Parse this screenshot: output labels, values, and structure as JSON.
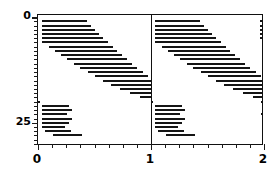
{
  "chart_data": {
    "type": "line",
    "title": "",
    "xlabel": "",
    "ylabel": "",
    "xlim": [
      0,
      2
    ],
    "ylim": [
      30.5,
      -0.5
    ],
    "grid": false,
    "legend": null,
    "x_ticks": [
      {
        "value": 0,
        "label": "0",
        "major": true
      },
      {
        "value": 0.125,
        "label": "",
        "major": false
      },
      {
        "value": 0.25,
        "label": "",
        "major": false
      },
      {
        "value": 0.375,
        "label": "",
        "major": false
      },
      {
        "value": 0.5,
        "label": "",
        "major": false
      },
      {
        "value": 0.625,
        "label": "",
        "major": false
      },
      {
        "value": 0.75,
        "label": "",
        "major": false
      },
      {
        "value": 0.875,
        "label": "",
        "major": false
      },
      {
        "value": 1,
        "label": "1",
        "major": true
      },
      {
        "value": 1.125,
        "label": "",
        "major": false
      },
      {
        "value": 1.25,
        "label": "",
        "major": false
      },
      {
        "value": 1.375,
        "label": "",
        "major": false
      },
      {
        "value": 1.5,
        "label": "",
        "major": false
      },
      {
        "value": 1.625,
        "label": "",
        "major": false
      },
      {
        "value": 1.75,
        "label": "",
        "major": false
      },
      {
        "value": 1.875,
        "label": "",
        "major": false
      },
      {
        "value": 2,
        "label": "2",
        "major": true
      }
    ],
    "y_ticks": [
      {
        "value": 0,
        "label": "0",
        "major": true
      },
      {
        "value": 1,
        "label": "",
        "major": false
      },
      {
        "value": 2,
        "label": "",
        "major": false
      },
      {
        "value": 3,
        "label": "",
        "major": false
      },
      {
        "value": 4,
        "label": "",
        "major": false
      },
      {
        "value": 5,
        "label": "",
        "major": false
      },
      {
        "value": 6,
        "label": "",
        "major": false
      },
      {
        "value": 7,
        "label": "",
        "major": false
      },
      {
        "value": 8,
        "label": "",
        "major": false
      },
      {
        "value": 9,
        "label": "",
        "major": false
      },
      {
        "value": 10,
        "label": "",
        "major": false
      },
      {
        "value": 11,
        "label": "",
        "major": false
      },
      {
        "value": 12,
        "label": "",
        "major": false
      },
      {
        "value": 13,
        "label": "",
        "major": false
      },
      {
        "value": 14,
        "label": "",
        "major": false
      },
      {
        "value": 15,
        "label": "",
        "major": false
      },
      {
        "value": 16,
        "label": "",
        "major": false
      },
      {
        "value": 17,
        "label": "",
        "major": false
      },
      {
        "value": 18,
        "label": "",
        "major": false
      },
      {
        "value": 19,
        "label": "",
        "major": false
      },
      {
        "value": 20,
        "label": "",
        "major": false
      },
      {
        "value": 21,
        "label": "",
        "major": false
      },
      {
        "value": 22,
        "label": "",
        "major": false
      },
      {
        "value": 23,
        "label": "",
        "major": false
      },
      {
        "value": 24,
        "label": "",
        "major": false
      },
      {
        "value": 25,
        "label": "25",
        "major": true
      },
      {
        "value": 26,
        "label": "",
        "major": false
      },
      {
        "value": 27,
        "label": "",
        "major": false
      },
      {
        "value": 28,
        "label": "",
        "major": false
      },
      {
        "value": 29,
        "label": "",
        "major": false
      },
      {
        "value": 30,
        "label": "",
        "major": false
      }
    ],
    "series": [
      {
        "name": "cycle-1",
        "type": "segments",
        "segments": [
          {
            "y": 1,
            "x0": 0.035,
            "x1": 0.43
          },
          {
            "y": 2,
            "x0": 0.035,
            "x1": 0.47
          },
          {
            "y": 3,
            "x0": 0.035,
            "x1": 0.505
          },
          {
            "y": 4,
            "x0": 0.035,
            "x1": 0.54
          },
          {
            "y": 5,
            "x0": 0.035,
            "x1": 0.575
          },
          {
            "y": 6,
            "x0": 0.035,
            "x1": 0.62
          },
          {
            "y": 7,
            "x0": 0.1,
            "x1": 0.665
          },
          {
            "y": 8,
            "x0": 0.15,
            "x1": 0.7
          },
          {
            "y": 9,
            "x0": 0.2,
            "x1": 0.745
          },
          {
            "y": 10,
            "x0": 0.255,
            "x1": 0.79
          },
          {
            "y": 11,
            "x0": 0.315,
            "x1": 0.835
          },
          {
            "y": 12,
            "x0": 0.375,
            "x1": 0.88
          },
          {
            "y": 13,
            "x0": 0.44,
            "x1": 0.925
          },
          {
            "y": 14,
            "x0": 0.505,
            "x1": 0.97
          },
          {
            "y": 15,
            "x0": 0.575,
            "x1": 1.0
          },
          {
            "y": 16,
            "x0": 0.65,
            "x1": 1.0
          },
          {
            "y": 17,
            "x0": 0.73,
            "x1": 1.0
          },
          {
            "y": 18,
            "x0": 0.815,
            "x1": 1.0
          },
          {
            "y": 19,
            "x0": 0.905,
            "x1": 1.0
          },
          {
            "y": 20,
            "x0": 0.0,
            "x1": 0.02
          },
          {
            "y": 21,
            "x0": 0.035,
            "x1": 0.27
          },
          {
            "y": 22,
            "x0": 0.035,
            "x1": 0.305
          },
          {
            "y": 23,
            "x0": 0.035,
            "x1": 0.255
          },
          {
            "y": 24,
            "x0": 0.035,
            "x1": 0.3
          },
          {
            "y": 25,
            "x0": 0.035,
            "x1": 0.27
          },
          {
            "y": 26,
            "x0": 0.035,
            "x1": 0.235
          },
          {
            "y": 27,
            "x0": 0.06,
            "x1": 0.29
          },
          {
            "y": 28,
            "x0": 0.13,
            "x1": 0.39
          }
        ]
      },
      {
        "name": "cycle-2",
        "type": "segments",
        "segments": [
          {
            "y": 1,
            "x0": 1.035,
            "x1": 1.43
          },
          {
            "y": 2,
            "x0": 1.035,
            "x1": 1.47
          },
          {
            "y": 3,
            "x0": 1.035,
            "x1": 1.505
          },
          {
            "y": 4,
            "x0": 1.035,
            "x1": 1.54
          },
          {
            "y": 5,
            "x0": 1.035,
            "x1": 1.575
          },
          {
            "y": 6,
            "x0": 1.035,
            "x1": 1.62
          },
          {
            "y": 7,
            "x0": 1.1,
            "x1": 1.665
          },
          {
            "y": 8,
            "x0": 1.15,
            "x1": 1.7
          },
          {
            "y": 9,
            "x0": 1.2,
            "x1": 1.745
          },
          {
            "y": 10,
            "x0": 1.255,
            "x1": 1.79
          },
          {
            "y": 11,
            "x0": 1.315,
            "x1": 1.835
          },
          {
            "y": 12,
            "x0": 1.375,
            "x1": 1.88
          },
          {
            "y": 13,
            "x0": 1.44,
            "x1": 1.925
          },
          {
            "y": 14,
            "x0": 1.505,
            "x1": 1.97
          },
          {
            "y": 15,
            "x0": 1.575,
            "x1": 2.0
          },
          {
            "y": 16,
            "x0": 1.65,
            "x1": 2.0
          },
          {
            "y": 17,
            "x0": 1.73,
            "x1": 2.0
          },
          {
            "y": 18,
            "x0": 1.815,
            "x1": 2.0
          },
          {
            "y": 19,
            "x0": 1.905,
            "x1": 2.0
          },
          {
            "y": 20,
            "x0": 1.0,
            "x1": 1.02
          },
          {
            "y": 21,
            "x0": 1.035,
            "x1": 1.27
          },
          {
            "y": 22,
            "x0": 1.035,
            "x1": 1.305
          },
          {
            "y": 23,
            "x0": 1.035,
            "x1": 1.255
          },
          {
            "y": 24,
            "x0": 1.035,
            "x1": 1.3
          },
          {
            "y": 25,
            "x0": 1.035,
            "x1": 1.27
          },
          {
            "y": 26,
            "x0": 1.035,
            "x1": 1.235
          },
          {
            "y": 27,
            "x0": 1.06,
            "x1": 1.29
          },
          {
            "y": 28,
            "x0": 1.13,
            "x1": 1.39
          }
        ]
      },
      {
        "name": "right-edge-marks",
        "type": "segments",
        "segments": [
          {
            "y": 1,
            "x0": 1.965,
            "x1": 2.0
          },
          {
            "y": 2,
            "x0": 1.965,
            "x1": 2.0
          },
          {
            "y": 3,
            "x0": 1.965,
            "x1": 2.0
          },
          {
            "y": 4,
            "x0": 1.965,
            "x1": 2.0
          },
          {
            "y": 5,
            "x0": 1.965,
            "x1": 2.0
          },
          {
            "y": 20,
            "x0": 1.975,
            "x1": 2.0
          },
          {
            "y": 23,
            "x0": 1.975,
            "x1": 2.0
          }
        ]
      }
    ]
  },
  "axes": {
    "divider_x": 1,
    "frame_color": "#111111",
    "segment_color": "#151515"
  }
}
